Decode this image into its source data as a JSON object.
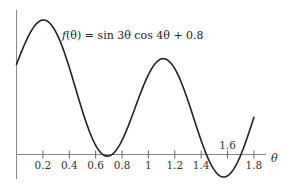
{
  "chart_data": {
    "type": "line",
    "title": "",
    "annotation": "f(θ) = sin 3θ cos 4θ + 0.8",
    "function": "sin(3*theta)*cos(4*theta)+0.8",
    "xlabel": "θ",
    "ylabel": "",
    "xlim": [
      0,
      1.9
    ],
    "ylim": [
      -0.25,
      1.25
    ],
    "x_ticks": [
      0.2,
      0.4,
      0.6,
      0.8,
      1,
      1.2,
      1.4,
      1.6,
      1.8
    ],
    "x_tick_labels": [
      "0.2",
      "0.4",
      "0.6",
      "0.8",
      "1",
      "1.2",
      "1.4",
      "1.6",
      "1.8"
    ],
    "x_tick_label_above": [
      "1.6"
    ],
    "grid": false,
    "legend": null,
    "series": [
      {
        "name": "f(θ)",
        "color": "#222222",
        "x": [
          0,
          0.1,
          0.2,
          0.21,
          0.3,
          0.4,
          0.5,
          0.6,
          0.7,
          0.8,
          0.9,
          1.0,
          1.1,
          1.2,
          1.3,
          1.4,
          1.5,
          1.57,
          1.6,
          1.7,
          1.8
        ],
        "y": [
          0.8,
          1.07,
          1.19,
          1.19,
          1.09,
          0.82,
          0.45,
          0.11,
          -0.06,
          0.08,
          0.36,
          0.71,
          0.85,
          0.77,
          0.49,
          0.11,
          -0.14,
          -0.2,
          -0.19,
          0.02,
          0.33
        ]
      }
    ],
    "notable_points": {
      "max_1": {
        "x": 0.21,
        "y": 1.19
      },
      "min_1": {
        "x": 0.7,
        "y": -0.06
      },
      "max_2": {
        "x": 1.11,
        "y": 0.85
      },
      "min_2": {
        "x": 1.57,
        "y": -0.2
      }
    }
  },
  "labels": {
    "fn_prefix": "f",
    "fn_arg": "(θ)",
    "fn_rhs": " = sin 3θ cos 4θ + 0.8",
    "axis_var": "θ"
  }
}
